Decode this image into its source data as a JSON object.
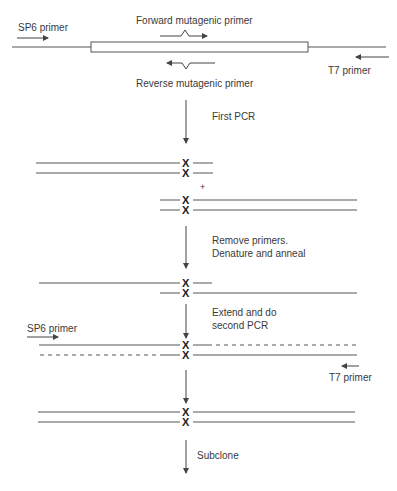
{
  "diagram": {
    "type": "overlap-extension PCR site-directed mutagenesis",
    "labels": {
      "sp6_primer_top": "SP6 primer",
      "forward_mutagenic_primer": "Forward mutagenic primer",
      "reverse_mutagenic_primer": "Reverse mutagenic primer",
      "t7_primer_top": "T7 primer",
      "plus": "+",
      "sp6_primer_bottom": "SP6 primer",
      "t7_primer_bottom": "T7 primer",
      "mutation_mark": "X"
    },
    "steps": [
      {
        "label": "First PCR"
      },
      {
        "label_line1": "Remove primers.",
        "label_line2": "Denature and anneal"
      },
      {
        "label_line1": "Extend and do",
        "label_line2": "second PCR"
      },
      {
        "label": ""
      },
      {
        "label": "Subclone"
      }
    ],
    "colors": {
      "line": "#555555",
      "text": "#3a3a3a",
      "mark": "#222222"
    }
  }
}
